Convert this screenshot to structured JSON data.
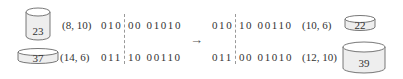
{
  "parents": [
    {
      "value": "23",
      "coords": "(8, 10)",
      "bits_left": "010",
      "bits_right": "00 01010",
      "shape": "tall-cylinder"
    },
    {
      "value": "37",
      "coords": "(14, 6)",
      "bits_left": "011",
      "bits_right": "10 00110",
      "shape": "flat-cylinder"
    }
  ],
  "children": [
    {
      "value": "22",
      "coords": "(10, 6)",
      "bits_left": "010",
      "bits_right": "10 00110",
      "shape": "flat-cylinder"
    },
    {
      "value": "39",
      "coords": "(12, 10)",
      "bits_left": "011",
      "bits_right": "00 01010",
      "shape": "tall-cylinder"
    }
  ],
  "arrow": "→"
}
